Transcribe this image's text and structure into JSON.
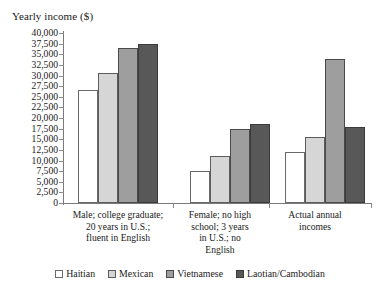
{
  "chart_data": {
    "type": "bar",
    "title": "",
    "ylabel": "Yearly income ($)",
    "xlabel": "",
    "ylim": [
      0,
      40000
    ],
    "ytick_step": 2500,
    "ytick_labels": [
      "40,000",
      "37,500",
      "35,000",
      "32,500",
      "30,000",
      "27,500",
      "25,000",
      "22,500",
      "20,000",
      "17,500",
      "15,000",
      "12,500",
      "10,000",
      "7,500",
      "5,000",
      "2,500",
      "0"
    ],
    "ytick_values": [
      40000,
      37500,
      35000,
      32500,
      30000,
      27500,
      25000,
      22500,
      20000,
      17500,
      15000,
      12500,
      10000,
      7500,
      5000,
      2500,
      0
    ],
    "grid": false,
    "legend_position": "bottom",
    "categories": [
      "Male; college graduate;\n20 years in U.S.;\nfluent in English",
      "Female; no high\nschool; 3 years\nin U.S.; no\nEnglish",
      "Actual annual\nincomes"
    ],
    "series": [
      {
        "name": "Haitian",
        "color": "#ffffff",
        "values": [
          26500,
          7500,
          12000
        ]
      },
      {
        "name": "Mexican",
        "color": "#d6d6d6",
        "values": [
          30500,
          11000,
          15500
        ]
      },
      {
        "name": "Vietnamese",
        "color": "#9e9e9e",
        "values": [
          36500,
          17500,
          34000
        ]
      },
      {
        "name": "Laotian/Cambodian",
        "color": "#585858",
        "values": [
          37500,
          18500,
          18000
        ]
      }
    ]
  }
}
